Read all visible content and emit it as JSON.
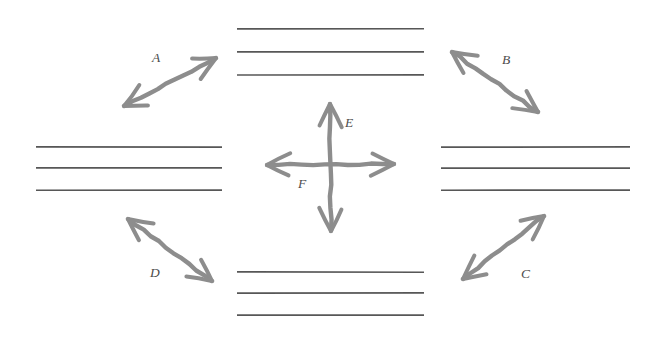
{
  "canvas": {
    "width": 658,
    "height": 354,
    "background_color": "#ffffff",
    "line_color": "#575757",
    "arrow_color": "#8d8d8d",
    "label_color": "#4c4c4c"
  },
  "line_groups": [
    {
      "name": "top",
      "count": 3,
      "orientation": "horizontal",
      "x_start": 237,
      "x_end": 424,
      "y_values": [
        29,
        52,
        75
      ]
    },
    {
      "name": "left",
      "count": 3,
      "orientation": "horizontal",
      "x_start": 36,
      "x_end": 222,
      "y_values": [
        147,
        168,
        190
      ]
    },
    {
      "name": "right",
      "count": 3,
      "orientation": "horizontal",
      "x_start": 441,
      "x_end": 630,
      "y_values": [
        147,
        168,
        190
      ]
    },
    {
      "name": "bottom",
      "count": 3,
      "orientation": "horizontal",
      "x_start": 237,
      "x_end": 424,
      "y_values": [
        272,
        293,
        315
      ]
    }
  ],
  "arrows": [
    {
      "id": "A",
      "label": "A",
      "style": "double-headed",
      "orientation": "diagonal-sw-ne",
      "position": "top-left",
      "x1": 124,
      "y1": 106,
      "x2": 216,
      "y2": 58,
      "label_x": 152,
      "label_y": 62
    },
    {
      "id": "B",
      "label": "B",
      "style": "double-headed",
      "orientation": "diagonal-nw-se",
      "position": "top-right",
      "x1": 452,
      "y1": 52,
      "x2": 538,
      "y2": 112,
      "label_x": 502,
      "label_y": 64
    },
    {
      "id": "C",
      "label": "C",
      "style": "double-headed",
      "orientation": "diagonal-sw-ne",
      "position": "bottom-right",
      "x1": 463,
      "y1": 279,
      "x2": 544,
      "y2": 216,
      "label_x": 521,
      "label_y": 278
    },
    {
      "id": "D",
      "label": "D",
      "style": "double-headed",
      "orientation": "diagonal-nw-se",
      "position": "bottom-left",
      "x1": 128,
      "y1": 219,
      "x2": 212,
      "y2": 281,
      "label_x": 150,
      "label_y": 277
    },
    {
      "id": "E",
      "label": "E",
      "style": "double-headed",
      "orientation": "vertical",
      "position": "center",
      "x1": 330,
      "y1": 104,
      "x2": 331,
      "y2": 231,
      "label_x": 345,
      "label_y": 127
    },
    {
      "id": "F",
      "label": "F",
      "style": "double-headed",
      "orientation": "horizontal",
      "position": "center",
      "x1": 267,
      "y1": 165,
      "x2": 394,
      "y2": 164,
      "label_x": 298,
      "label_y": 188
    }
  ]
}
